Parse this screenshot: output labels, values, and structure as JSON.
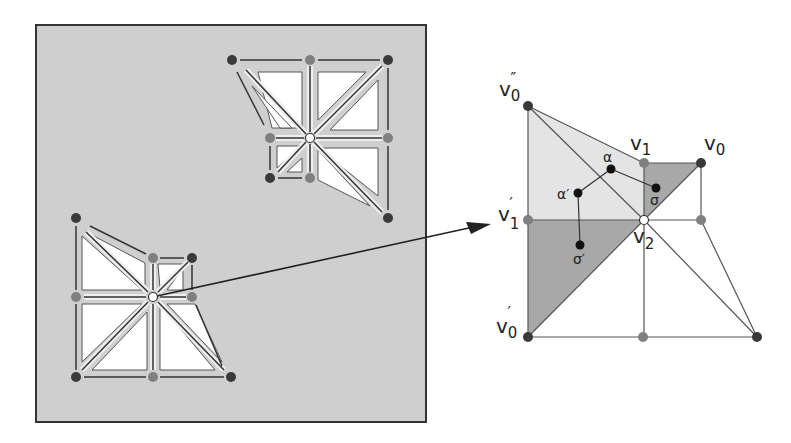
{
  "figure": {
    "colors": {
      "panel_fill": "#cfcfcf",
      "panel_border": "#333333",
      "vertex_dark": "#3a3a3a",
      "vertex_mid": "#808080",
      "vertex_center": "#ffffff",
      "light_region": "#e4e4e4",
      "dark_region": "#a8a8a8",
      "edge": "#444444"
    },
    "labels": {
      "v0_double_prime": "v",
      "v0_double_prime_sub": "0",
      "v0_double_prime_sup": "″",
      "v1": "v",
      "v1_sub": "1",
      "v0": "v",
      "v0_sub": "0",
      "v1_prime": "v",
      "v1_prime_sub": "1",
      "v1_prime_sup": "′",
      "v2": "v",
      "v2_sub": "2",
      "v0_prime": "v",
      "v0_prime_sub": "0",
      "v0_prime_sup": "′",
      "alpha": "α",
      "alpha_prime": "α′",
      "sigma": "σ",
      "sigma_prime": "σ′"
    }
  }
}
